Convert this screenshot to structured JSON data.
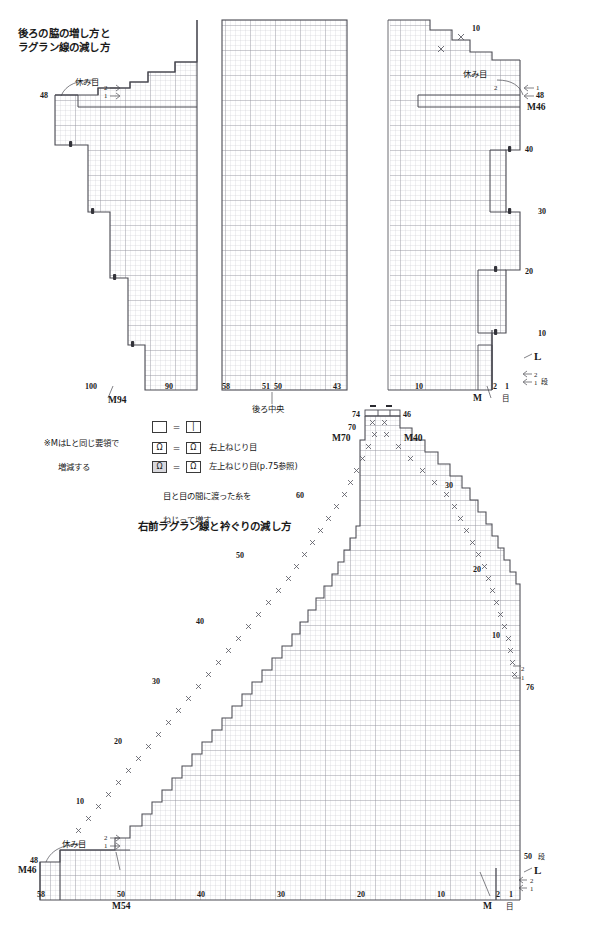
{
  "page": {
    "width": 598,
    "height": 940,
    "background": "#ffffff",
    "gridline": "#b9b9c4",
    "gridline_major": "#8a8a96",
    "outline": "#4a4a52"
  },
  "charts": {
    "back": {
      "title_line1": "後ろの脇の増し方と",
      "title_line2": "ラグラン線の減し方",
      "center_label": "後ろ中央",
      "left_panel": {
        "axis_x_ticks": [
          "100",
          "90"
        ],
        "axis_M": "M94",
        "row_left_top": "48",
        "hold_stitches": "休み目",
        "step_2": "2",
        "step_1": "1"
      },
      "mid_panel": {
        "axis_x_ticks": [
          "58",
          "51",
          "50",
          "43"
        ]
      },
      "right_panel": {
        "axis_x_ticks": [
          "10",
          "2",
          "1"
        ],
        "axis_x_unit": "目",
        "axis_M": "M",
        "row_top_10": "10",
        "hold_stitches": "休み目",
        "step_2": "2",
        "step_1": "1",
        "row_48": "48",
        "row_M46": "M46",
        "row_40": "40",
        "row_30": "30",
        "row_20": "20",
        "row_10": "10",
        "label_L": "L",
        "row_2": "2",
        "row_1": "1",
        "row_unit": "段"
      }
    },
    "front": {
      "title": "右前ラグラン線と衿ぐりの減し方",
      "top_marks": {
        "left": "74",
        "right": "46"
      },
      "left_steps": [
        "70",
        "M70",
        "60",
        "50",
        "40",
        "30",
        "20",
        "10"
      ],
      "right_steps": [
        "46",
        "M40",
        "30",
        "20",
        "10",
        "2",
        "1",
        "76"
      ],
      "axis_x_ticks": [
        "58",
        "50",
        "40",
        "30",
        "20",
        "10",
        "2",
        "1"
      ],
      "axis_x_unit": "目",
      "axis_M_left": "M54",
      "axis_M_right": "M",
      "bottom_left": {
        "row_48": "48",
        "row_M46": "M46",
        "hold_stitches": "休み目",
        "step_2": "2",
        "step_1": "1"
      },
      "bottom_right": {
        "row_50": "50",
        "row_unit": "段",
        "label_L": "L",
        "row_2": "2",
        "row_1": "1"
      }
    }
  },
  "legend": {
    "note_M": "※MはLと同じ要領で",
    "note_M2": "増減する",
    "rows": [
      {
        "left_symbol": "",
        "right_symbol": "|",
        "text": ""
      },
      {
        "left_symbol": "Ω",
        "right_symbol": "Ω",
        "text": "右上ねじり目"
      },
      {
        "left_symbol": "Ω",
        "right_symbol": "Ω",
        "text": "左上ねじり目(p.75参照)"
      }
    ],
    "footnote_line1": "目と目の間に渡った糸を",
    "footnote_line2": "ねじって増す"
  }
}
